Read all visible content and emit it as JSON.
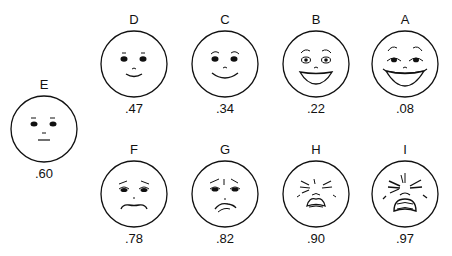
{
  "faces": [
    {
      "id": "E",
      "letter": "E",
      "value": ".60",
      "expression": "neutral"
    },
    {
      "id": "D",
      "letter": "D",
      "value": ".47",
      "expression": "slight-smile"
    },
    {
      "id": "C",
      "letter": "C",
      "value": ".34",
      "expression": "smile"
    },
    {
      "id": "B",
      "letter": "B",
      "value": ".22",
      "expression": "big-smile"
    },
    {
      "id": "A",
      "letter": "A",
      "value": ".08",
      "expression": "laughing"
    },
    {
      "id": "F",
      "letter": "F",
      "value": ".78",
      "expression": "slight-frown"
    },
    {
      "id": "G",
      "letter": "G",
      "value": ".82",
      "expression": "sad"
    },
    {
      "id": "H",
      "letter": "H",
      "value": ".90",
      "expression": "very-sad"
    },
    {
      "id": "I",
      "letter": "I",
      "value": ".97",
      "expression": "crying"
    }
  ]
}
